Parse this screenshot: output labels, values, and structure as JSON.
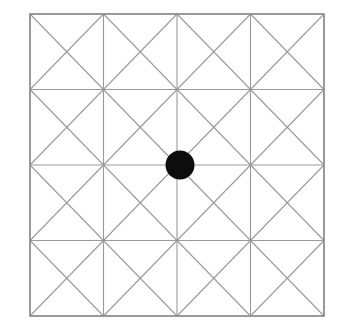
{
  "figure": {
    "name": "tessellated-square-grid-with-center-dot",
    "canvas": {
      "width": 339,
      "height": 333,
      "background_color": "#ffffff"
    },
    "square": {
      "x": 30,
      "y": 14,
      "width": 294,
      "height": 302,
      "stroke_color": "#8e8e8e",
      "stroke_width": 1.6,
      "fill": "none"
    },
    "grid": {
      "rows": 4,
      "cols": 4,
      "line_color": "#9a9a9a",
      "line_width": 1.1,
      "x_positions": [
        30,
        103.5,
        177,
        250.5,
        324
      ],
      "y_positions": [
        14,
        89.5,
        165,
        240.5,
        316
      ],
      "cell_width": 73.5,
      "cell_height": 75.5,
      "diagonals_per_cell": 2,
      "diagonal_color": "#9a9a9a",
      "diagonal_width": 1.1,
      "total_cells": 16,
      "total_triangles": 64
    },
    "dot": {
      "label": "center-dot",
      "cx": 180,
      "cy": 165,
      "r": 14.5,
      "fill_color": "#0d0d0d",
      "stroke": "none"
    }
  },
  "chart_data": {
    "type": "scatter",
    "title": "",
    "xlabel": "",
    "ylabel": "",
    "xlim": [
      0,
      4
    ],
    "ylim": [
      0,
      4
    ],
    "grid": true,
    "legend": "none",
    "categories": [
      "column 1",
      "column 2",
      "column 3",
      "column 4"
    ],
    "series": [
      {
        "name": "marked point",
        "points": [
          {
            "x": 2,
            "y": 2
          }
        ],
        "marker": "filled-circle",
        "color": "#0d0d0d",
        "size": 29
      }
    ],
    "annotations": [
      {
        "text": "",
        "x": 2,
        "y": 2
      }
    ]
  }
}
